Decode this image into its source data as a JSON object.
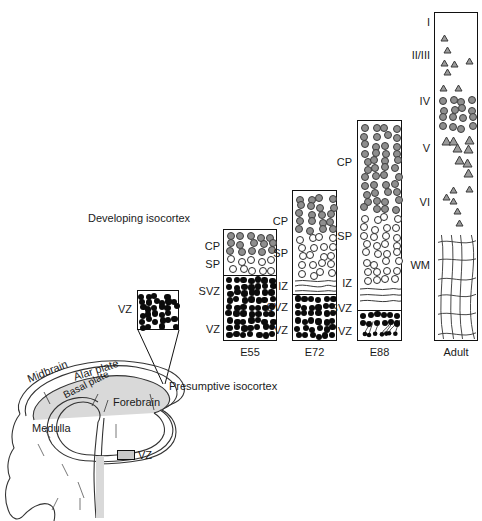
{
  "figure": {
    "caption_top": "Developing isocortex",
    "inset": {
      "label": "VZ"
    },
    "legend": {
      "vz_key_label": "VZ"
    }
  },
  "brain": {
    "labels": [
      {
        "text": "Midbrain",
        "rotate": -22
      },
      {
        "text": "Alar plate",
        "rotate": -18
      },
      {
        "text": "Basal plate",
        "rotate": -27
      },
      {
        "text": "Forebrain",
        "rotate": 0
      },
      {
        "text": "Medulla",
        "rotate": 0
      },
      {
        "text": "Presumptive isocortex",
        "rotate": 0
      }
    ]
  },
  "columns": [
    {
      "id": "e55",
      "stage": "E55",
      "zones": [
        {
          "label": "CP",
          "cell_style": "gray"
        },
        {
          "label": "SP",
          "cell_style": "open"
        },
        {
          "label": "SVZ",
          "cell_style": "black"
        },
        {
          "label": "VZ",
          "cell_style": "black"
        }
      ]
    },
    {
      "id": "e72",
      "stage": "E72",
      "zones": [
        {
          "label": "CP",
          "cell_style": "gray"
        },
        {
          "label": "SP",
          "cell_style": "open"
        },
        {
          "label": "IZ",
          "cell_style": "fibers"
        },
        {
          "label": "SVZ",
          "cell_style": "black"
        },
        {
          "label": "VZ",
          "cell_style": "black"
        }
      ]
    },
    {
      "id": "e88",
      "stage": "E88",
      "zones": [
        {
          "label": "CP",
          "cell_style": "gray"
        },
        {
          "label": "SP",
          "cell_style": "open"
        },
        {
          "label": "IZ",
          "cell_style": "fibers"
        },
        {
          "label": "SVZ",
          "cell_style": "black"
        },
        {
          "label": "VZ",
          "cell_style": "black-tailed"
        }
      ]
    },
    {
      "id": "adult",
      "stage": "Adult",
      "zones": [
        {
          "label": "I",
          "cell_style": "triangle"
        },
        {
          "label": "II/III",
          "cell_style": "triangle"
        },
        {
          "label": "IV",
          "cell_style": "gray"
        },
        {
          "label": "V",
          "cell_style": "triangle"
        },
        {
          "label": "VI",
          "cell_style": "triangle"
        },
        {
          "label": "WM",
          "cell_style": "fibers"
        }
      ]
    }
  ],
  "colors": {
    "outline": "#111111",
    "gray_cell": "#8e8e8e",
    "black_cell": "#0b0b0b",
    "open_cell": "#ffffff",
    "background": "#ffffff"
  }
}
